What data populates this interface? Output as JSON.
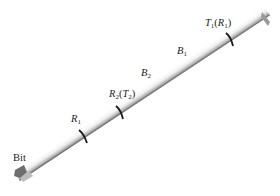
{
  "figure": {
    "type": "drill-string-bha-diagram",
    "labels": {
      "bit": "Bit",
      "r1": {
        "main": "R",
        "sub": "1"
      },
      "r2t2": {
        "main": "R",
        "sub": "2",
        "paren_main": "T",
        "paren_sub": "2"
      },
      "b2": {
        "main": "B",
        "sub": "2"
      },
      "b1": {
        "main": "B",
        "sub": "1"
      },
      "t1r1": {
        "main": "T",
        "sub": "1",
        "paren_main": "R",
        "paren_sub": "1"
      }
    },
    "colors": {
      "pipe_light": "#f2f2f2",
      "pipe_shadow": "#8a8a8a",
      "marker": "#1a1a1a",
      "bit": "#6e6e6e"
    }
  }
}
